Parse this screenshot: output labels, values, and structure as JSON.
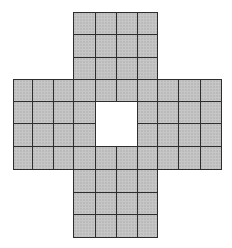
{
  "diagram": {
    "type": "cross-shaped grid board",
    "columns": 10,
    "rows": 10,
    "cell_fill": "#c6c6c6",
    "line_color": "#2e2e2e",
    "background": "#ffffff",
    "col_edges": [
      13,
      32,
      53,
      73,
      95,
      116,
      137,
      157,
      178,
      200,
      221
    ],
    "row_edges": [
      12,
      34,
      57,
      79,
      101,
      123,
      146,
      169,
      192,
      214,
      237
    ],
    "shape_rows": [
      "...####...",
      "...####...",
      "...####...",
      "##########",
      "####..####",
      "####..####",
      "##########",
      "...####...",
      "...####...",
      "...####..."
    ],
    "center_hole": {
      "col_start": 4,
      "col_end": 5,
      "row_start": 4,
      "row_end": 5
    }
  }
}
